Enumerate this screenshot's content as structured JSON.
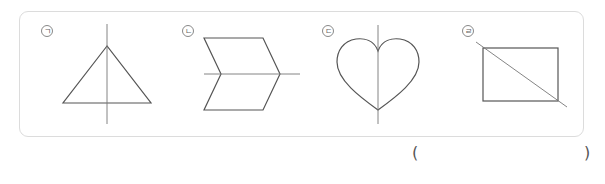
{
  "question": {
    "options": [
      {
        "id": "1",
        "label": "ㄱ",
        "shape": "triangle",
        "axis": "vertical"
      },
      {
        "id": "2",
        "label": "ㄴ",
        "shape": "chevron",
        "axis": "horizontal"
      },
      {
        "id": "3",
        "label": "ㄷ",
        "shape": "heart",
        "axis": "vertical"
      },
      {
        "id": "4",
        "label": "ㄹ",
        "shape": "rectangle",
        "axis": "diagonal"
      }
    ],
    "answer_open": "(",
    "answer_close": ")",
    "stroke_color": "#555555",
    "border_color": "#dcdcdc"
  }
}
